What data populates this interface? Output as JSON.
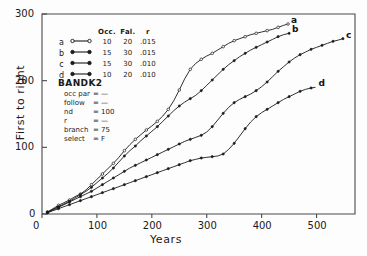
{
  "chart_data": {
    "type": "line",
    "title": "",
    "xlabel": "Years",
    "ylabel": "First to right",
    "xlim": [
      0,
      570
    ],
    "ylim": [
      0,
      300
    ],
    "xticks": [
      0,
      100,
      200,
      300,
      400,
      500
    ],
    "yticks": [
      0,
      100,
      200,
      300
    ],
    "grid": false,
    "legend_position": "upper-left-inside",
    "series": [
      {
        "name": "a",
        "marker": "open-circle",
        "end_label": "a",
        "params": {
          "Occ.": 10,
          "Fal.": 20,
          "r": ".015"
        },
        "points": [
          [
            10,
            3
          ],
          [
            20,
            8
          ],
          [
            30,
            13
          ],
          [
            40,
            17
          ],
          [
            50,
            21
          ],
          [
            60,
            26
          ],
          [
            70,
            30
          ],
          [
            80,
            36
          ],
          [
            90,
            44
          ],
          [
            100,
            52
          ],
          [
            110,
            60
          ],
          [
            120,
            68
          ],
          [
            130,
            76
          ],
          [
            140,
            85
          ],
          [
            150,
            95
          ],
          [
            160,
            104
          ],
          [
            170,
            112
          ],
          [
            180,
            119
          ],
          [
            190,
            126
          ],
          [
            200,
            132
          ],
          [
            210,
            139
          ],
          [
            220,
            147
          ],
          [
            230,
            157
          ],
          [
            240,
            170
          ],
          [
            250,
            186
          ],
          [
            260,
            203
          ],
          [
            270,
            217
          ],
          [
            280,
            226
          ],
          [
            290,
            232
          ],
          [
            300,
            237
          ],
          [
            310,
            241
          ],
          [
            320,
            246
          ],
          [
            330,
            251
          ],
          [
            340,
            256
          ],
          [
            350,
            260
          ],
          [
            360,
            263
          ],
          [
            370,
            266
          ],
          [
            380,
            269
          ],
          [
            390,
            271
          ],
          [
            400,
            273
          ],
          [
            410,
            275
          ],
          [
            420,
            277
          ],
          [
            430,
            280
          ],
          [
            440,
            283
          ],
          [
            448,
            285
          ]
        ]
      },
      {
        "name": "b",
        "marker": "filled-dot",
        "end_label": "b",
        "params": {
          "Occ.": 15,
          "Fal.": 30,
          "r": ".015"
        },
        "points": [
          [
            10,
            3
          ],
          [
            20,
            7
          ],
          [
            30,
            11
          ],
          [
            40,
            15
          ],
          [
            50,
            19
          ],
          [
            60,
            24
          ],
          [
            70,
            29
          ],
          [
            80,
            34
          ],
          [
            90,
            40
          ],
          [
            100,
            47
          ],
          [
            110,
            54
          ],
          [
            120,
            61
          ],
          [
            130,
            69
          ],
          [
            140,
            78
          ],
          [
            150,
            87
          ],
          [
            160,
            95
          ],
          [
            170,
            102
          ],
          [
            180,
            110
          ],
          [
            190,
            117
          ],
          [
            200,
            124
          ],
          [
            210,
            131
          ],
          [
            220,
            139
          ],
          [
            230,
            147
          ],
          [
            240,
            155
          ],
          [
            250,
            162
          ],
          [
            260,
            168
          ],
          [
            270,
            173
          ],
          [
            280,
            178
          ],
          [
            290,
            185
          ],
          [
            300,
            193
          ],
          [
            310,
            201
          ],
          [
            320,
            209
          ],
          [
            330,
            217
          ],
          [
            340,
            224
          ],
          [
            350,
            230
          ],
          [
            360,
            236
          ],
          [
            370,
            241
          ],
          [
            380,
            246
          ],
          [
            390,
            250
          ],
          [
            400,
            254
          ],
          [
            410,
            258
          ],
          [
            420,
            262
          ],
          [
            430,
            266
          ],
          [
            440,
            269
          ],
          [
            450,
            271
          ]
        ]
      },
      {
        "name": "c",
        "marker": "filled-dot",
        "end_label": "c",
        "params": {
          "Occ.": 15,
          "Fal.": 30,
          "r": ".010"
        },
        "points": [
          [
            10,
            2
          ],
          [
            20,
            6
          ],
          [
            30,
            10
          ],
          [
            40,
            14
          ],
          [
            50,
            18
          ],
          [
            60,
            22
          ],
          [
            70,
            26
          ],
          [
            80,
            30
          ],
          [
            90,
            34
          ],
          [
            100,
            39
          ],
          [
            110,
            44
          ],
          [
            120,
            49
          ],
          [
            130,
            54
          ],
          [
            140,
            59
          ],
          [
            150,
            64
          ],
          [
            160,
            69
          ],
          [
            170,
            73
          ],
          [
            180,
            77
          ],
          [
            190,
            81
          ],
          [
            200,
            85
          ],
          [
            210,
            89
          ],
          [
            220,
            93
          ],
          [
            230,
            97
          ],
          [
            240,
            101
          ],
          [
            250,
            105
          ],
          [
            260,
            109
          ],
          [
            270,
            112
          ],
          [
            280,
            115
          ],
          [
            290,
            118
          ],
          [
            300,
            123
          ],
          [
            310,
            131
          ],
          [
            320,
            141
          ],
          [
            330,
            151
          ],
          [
            340,
            160
          ],
          [
            350,
            167
          ],
          [
            360,
            172
          ],
          [
            370,
            176
          ],
          [
            380,
            180
          ],
          [
            390,
            185
          ],
          [
            400,
            191
          ],
          [
            410,
            198
          ],
          [
            420,
            206
          ],
          [
            430,
            214
          ],
          [
            440,
            221
          ],
          [
            450,
            228
          ],
          [
            460,
            234
          ],
          [
            470,
            239
          ],
          [
            480,
            243
          ],
          [
            490,
            247
          ],
          [
            500,
            250
          ],
          [
            510,
            253
          ],
          [
            520,
            256
          ],
          [
            530,
            259
          ],
          [
            540,
            261
          ],
          [
            548,
            263
          ]
        ]
      },
      {
        "name": "d",
        "marker": "filled-dot",
        "end_label": "d",
        "params": {
          "Occ.": 10,
          "Fal.": 20,
          "r": ".010"
        },
        "points": [
          [
            10,
            2
          ],
          [
            20,
            5
          ],
          [
            30,
            8
          ],
          [
            40,
            11
          ],
          [
            50,
            14
          ],
          [
            60,
            17
          ],
          [
            70,
            20
          ],
          [
            80,
            23
          ],
          [
            90,
            26
          ],
          [
            100,
            29
          ],
          [
            110,
            32
          ],
          [
            120,
            35
          ],
          [
            130,
            38
          ],
          [
            140,
            41
          ],
          [
            150,
            44
          ],
          [
            160,
            47
          ],
          [
            170,
            50
          ],
          [
            180,
            53
          ],
          [
            190,
            56
          ],
          [
            200,
            59
          ],
          [
            210,
            62
          ],
          [
            220,
            65
          ],
          [
            230,
            68
          ],
          [
            240,
            71
          ],
          [
            250,
            74
          ],
          [
            260,
            77
          ],
          [
            270,
            80
          ],
          [
            280,
            82
          ],
          [
            290,
            84
          ],
          [
            300,
            85
          ],
          [
            310,
            86
          ],
          [
            320,
            87
          ],
          [
            330,
            90
          ],
          [
            340,
            97
          ],
          [
            350,
            106
          ],
          [
            360,
            117
          ],
          [
            370,
            128
          ],
          [
            380,
            138
          ],
          [
            390,
            146
          ],
          [
            400,
            152
          ],
          [
            410,
            157
          ],
          [
            420,
            162
          ],
          [
            430,
            167
          ],
          [
            440,
            172
          ],
          [
            450,
            176
          ],
          [
            460,
            180
          ],
          [
            470,
            184
          ],
          [
            480,
            187
          ],
          [
            490,
            189
          ],
          [
            498,
            190
          ]
        ]
      }
    ]
  },
  "legend": {
    "headers": [
      "Occ.",
      "Fal.",
      "r"
    ],
    "rows": [
      {
        "key": "a",
        "occ": "10",
        "fal": "20",
        "r": ".015",
        "marker": "open-circle"
      },
      {
        "key": "b",
        "occ": "15",
        "fal": "30",
        "r": ".015",
        "marker": "filled-dot"
      },
      {
        "key": "c",
        "occ": "15",
        "fal": "30",
        "r": ".010",
        "marker": "filled-dot"
      },
      {
        "key": "d",
        "occ": "10",
        "fal": "20",
        "r": ".010",
        "marker": "filled-dot"
      }
    ]
  },
  "params_block": {
    "title": "BANDK2",
    "rows": [
      {
        "name": "occ par",
        "eq": "=",
        "value": "—"
      },
      {
        "name": "follow",
        "eq": "=",
        "value": "—"
      },
      {
        "name": "nd",
        "eq": "=",
        "value": "100"
      },
      {
        "name": "r",
        "eq": "=",
        "value": "—"
      },
      {
        "name": "branch",
        "eq": "=",
        "value": "75"
      },
      {
        "name": "select",
        "eq": "=",
        "value": "F"
      }
    ]
  },
  "axes": {
    "xlabel": "Years",
    "ylabel": "First to right",
    "xtick_labels": [
      "0",
      "100",
      "200",
      "300",
      "400",
      "500"
    ],
    "ytick_labels": [
      "0",
      "100",
      "200",
      "300"
    ]
  },
  "colors": {
    "line": "#1a1a1a",
    "frame": "#4a4a4a",
    "background": "#fdfdfd"
  }
}
